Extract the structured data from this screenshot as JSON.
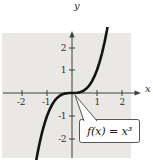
{
  "figure": {
    "annotation": "f(x) = x³"
  },
  "chart_data": {
    "type": "line",
    "title": "",
    "xlabel": "x",
    "ylabel": "y",
    "xlim": [
      -2.8,
      2.4
    ],
    "ylim": [
      -2.83,
      2.61
    ],
    "x_tick_labels": [
      "-2",
      "-1",
      "1",
      "2"
    ],
    "y_tick_labels": [
      "2",
      "1",
      "-1",
      "-2"
    ],
    "x_tick_values": [
      -2,
      -1,
      1,
      2
    ],
    "y_tick_values": [
      2,
      1,
      -1,
      -2
    ],
    "grid": false,
    "legend_position": "none",
    "annotation": "f(x) = x³",
    "series": [
      {
        "name": "f(x) = x³",
        "points": [
          [
            -1.5,
            -3.375
          ],
          [
            -1.4,
            -2.744
          ],
          [
            -1.3,
            -2.197
          ],
          [
            -1.2,
            -1.728
          ],
          [
            -1.1,
            -1.331
          ],
          [
            -1.0,
            -1.0
          ],
          [
            -0.9,
            -0.729
          ],
          [
            -0.8,
            -0.512
          ],
          [
            -0.7,
            -0.343
          ],
          [
            -0.6,
            -0.216
          ],
          [
            -0.5,
            -0.125
          ],
          [
            -0.4,
            -0.064
          ],
          [
            -0.3,
            -0.027
          ],
          [
            -0.2,
            -0.008
          ],
          [
            -0.1,
            -0.001
          ],
          [
            0,
            0
          ],
          [
            0.1,
            0.001
          ],
          [
            0.2,
            0.008
          ],
          [
            0.3,
            0.027
          ],
          [
            0.4,
            0.064
          ],
          [
            0.5,
            0.125
          ],
          [
            0.6,
            0.216
          ],
          [
            0.7,
            0.343
          ],
          [
            0.8,
            0.512
          ],
          [
            0.9,
            0.729
          ],
          [
            1.0,
            1.0
          ],
          [
            1.1,
            1.331
          ],
          [
            1.2,
            1.728
          ],
          [
            1.3,
            2.197
          ],
          [
            1.4,
            2.744
          ],
          [
            1.5,
            3.375
          ]
        ]
      }
    ],
    "colors": {
      "plot_background": "#e9e8e4",
      "curve": "#141414",
      "axis": "#3f3f3f",
      "callout_background": "#ffffff",
      "callout_border": "#555555"
    }
  }
}
